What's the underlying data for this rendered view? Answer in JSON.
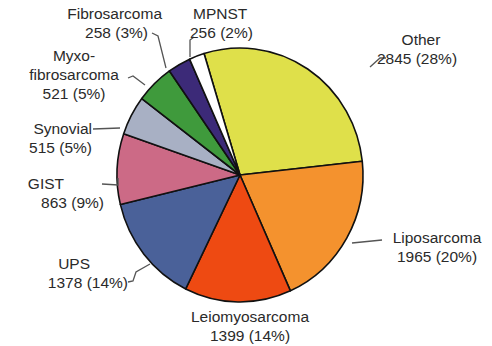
{
  "chart_data": {
    "type": "pie",
    "title": "",
    "start_angle_deg": -17,
    "direction": "clockwise",
    "slices": [
      {
        "label": "Other",
        "value": 2845,
        "percent": 28,
        "color": "#dfe04a"
      },
      {
        "label": "Liposarcoma",
        "value": 1965,
        "percent": 20,
        "color": "#f4922e"
      },
      {
        "label": "Leiomyosarcoma",
        "value": 1399,
        "percent": 14,
        "color": "#ee4a12"
      },
      {
        "label": "UPS",
        "value": 1378,
        "percent": 14,
        "color": "#4a6199"
      },
      {
        "label": "GIST",
        "value": 863,
        "percent": 9,
        "color": "#cc6a86"
      },
      {
        "label": "Synovial",
        "value": 515,
        "percent": 5,
        "color": "#a8b0c4"
      },
      {
        "label": "Myxofibrosarcoma",
        "value": 521,
        "percent": 5,
        "color": "#3f9a3c"
      },
      {
        "label": "Fibrosarcoma",
        "value": 258,
        "percent": 3,
        "color": "#3c2a78"
      },
      {
        "label": "MPNST",
        "value": 256,
        "percent": 2,
        "color": "#ffffff"
      }
    ]
  },
  "labels": {
    "other": {
      "name": "Other",
      "value": "2845 (28%)"
    },
    "liposarcoma": {
      "name": "Liposarcoma",
      "value": "1965 (20%)"
    },
    "leiomyosarcoma": {
      "name": "Leiomyosarcoma",
      "value": "1399 (14%)"
    },
    "ups": {
      "name": "UPS",
      "value": "1378 (14%)"
    },
    "gist": {
      "name": "GIST",
      "value": "863 (9%)"
    },
    "synovial": {
      "name": "Synovial",
      "value": "515 (5%)"
    },
    "myxo": {
      "name1": "Myxo-",
      "name2": "fibrosarcoma",
      "value": "521 (5%)"
    },
    "fibrosarcoma": {
      "name": "Fibrosarcoma",
      "value": "258 (3%)"
    },
    "mpnst": {
      "name": "MPNST",
      "value": "256 (2%)"
    }
  }
}
